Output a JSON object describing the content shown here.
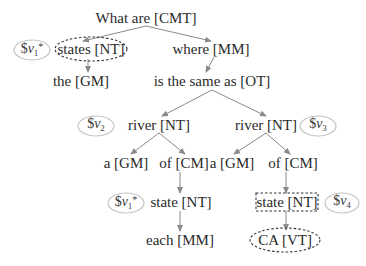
{
  "diagram": {
    "nodes": [
      {
        "id": "n_what",
        "label": "What are [CMT]",
        "x": 146,
        "y": 18
      },
      {
        "id": "n_states",
        "label": "states [NT]",
        "x": 91,
        "y": 49
      },
      {
        "id": "n_where",
        "label": "where [MM]",
        "x": 211,
        "y": 49
      },
      {
        "id": "n_the",
        "label": "the [GM]",
        "x": 81,
        "y": 81
      },
      {
        "id": "n_same",
        "label": "is the same as [OT]",
        "x": 212,
        "y": 81
      },
      {
        "id": "n_river_l",
        "label": "river [NT]",
        "x": 159,
        "y": 125
      },
      {
        "id": "n_river_r",
        "label": "river [NT]",
        "x": 266,
        "y": 125
      },
      {
        "id": "n_a_l",
        "label": "a [GM]",
        "x": 126,
        "y": 163
      },
      {
        "id": "n_of_l",
        "label": "of [CM]",
        "x": 184,
        "y": 163
      },
      {
        "id": "n_a_r",
        "label": "a [GM]",
        "x": 232,
        "y": 163
      },
      {
        "id": "n_of_r",
        "label": "of [CM]",
        "x": 293,
        "y": 163
      },
      {
        "id": "n_state_l",
        "label": "state [NT]",
        "x": 181,
        "y": 202
      },
      {
        "id": "n_state_r",
        "label": "state [NT]",
        "x": 287,
        "y": 202
      },
      {
        "id": "n_each",
        "label": "each [MM]",
        "x": 180,
        "y": 240
      },
      {
        "id": "n_ca",
        "label": "CA [VT]",
        "x": 285,
        "y": 240
      }
    ],
    "variables": [
      {
        "id": "v1a",
        "prefix": "$",
        "name": "v",
        "sub": "1",
        "sup": "*",
        "x": 32,
        "y": 50,
        "rx": 18,
        "ry": 10
      },
      {
        "id": "v2",
        "prefix": "$",
        "name": "v",
        "sub": "2",
        "sup": "",
        "x": 96,
        "y": 126,
        "rx": 18,
        "ry": 10
      },
      {
        "id": "v3",
        "prefix": "$",
        "name": "v",
        "sub": "3",
        "sup": "",
        "x": 318,
        "y": 126,
        "rx": 18,
        "ry": 10
      },
      {
        "id": "v1b",
        "prefix": "$",
        "name": "v",
        "sub": "1",
        "sup": "*",
        "x": 126,
        "y": 203,
        "rx": 18,
        "ry": 10
      },
      {
        "id": "v4",
        "prefix": "$",
        "name": "v",
        "sub": "4",
        "sup": "",
        "x": 342,
        "y": 203,
        "rx": 17,
        "ry": 10
      }
    ],
    "edges": [
      {
        "from": [
          146,
          26
        ],
        "to": [
          83,
          41
        ]
      },
      {
        "from": [
          146,
          26
        ],
        "to": [
          211,
          41
        ]
      },
      {
        "from": [
          88,
          59
        ],
        "to": [
          88,
          72
        ]
      },
      {
        "from": [
          214,
          57
        ],
        "to": [
          206,
          72
        ]
      },
      {
        "from": [
          212,
          90
        ],
        "to": [
          162,
          116
        ]
      },
      {
        "from": [
          212,
          90
        ],
        "to": [
          266,
          116
        ]
      },
      {
        "from": [
          159,
          133
        ],
        "to": [
          131,
          154
        ]
      },
      {
        "from": [
          159,
          133
        ],
        "to": [
          185,
          154
        ]
      },
      {
        "from": [
          266,
          133
        ],
        "to": [
          234,
          154
        ]
      },
      {
        "from": [
          266,
          133
        ],
        "to": [
          290,
          154
        ]
      },
      {
        "from": [
          180,
          172
        ],
        "to": [
          180,
          193
        ]
      },
      {
        "from": [
          180,
          211
        ],
        "to": [
          180,
          231
        ]
      },
      {
        "from": [
          286,
          172
        ],
        "to": [
          286,
          193
        ]
      },
      {
        "from": [
          286,
          211
        ],
        "to": [
          286,
          230
        ]
      }
    ],
    "highlights": [
      {
        "type": "dashed-ellipse",
        "target": "n_states",
        "cx": 91,
        "cy": 49,
        "rx": 36,
        "ry": 12
      },
      {
        "type": "dashed-rect",
        "target": "n_state_r",
        "x": 256,
        "y": 193,
        "w": 62,
        "h": 18
      },
      {
        "type": "dashed-ellipse",
        "target": "n_ca",
        "cx": 285,
        "cy": 240,
        "rx": 35,
        "ry": 12
      }
    ],
    "colors": {
      "text": "#2a2a2a",
      "edge": "#8a8a8a",
      "variable_outline": "#c4c4c4",
      "dashed_outline": "#333333"
    }
  }
}
